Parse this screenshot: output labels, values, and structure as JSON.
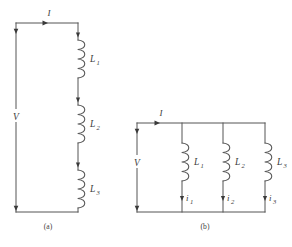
{
  "figure": {
    "background_color": "#ffffff",
    "line_color": "#555555",
    "text_color": "#3c3c3c"
  },
  "panels": [
    {
      "id": "panel-a",
      "caption": "(a)",
      "configuration": "series",
      "source_label": "V",
      "total_current_label": "I",
      "inductors": [
        {
          "label": "L",
          "subscript": "1"
        },
        {
          "label": "L",
          "subscript": "2"
        },
        {
          "label": "L",
          "subscript": "3"
        }
      ],
      "branch_currents": []
    },
    {
      "id": "panel-b",
      "caption": "(b)",
      "configuration": "parallel",
      "source_label": "V",
      "total_current_label": "I",
      "inductors": [
        {
          "label": "L",
          "subscript": "1"
        },
        {
          "label": "L",
          "subscript": "2"
        },
        {
          "label": "L",
          "subscript": "3"
        }
      ],
      "branch_currents": [
        {
          "label": "i",
          "subscript": "1"
        },
        {
          "label": "i",
          "subscript": "2"
        },
        {
          "label": "i",
          "subscript": "3"
        }
      ]
    }
  ],
  "labels": {
    "a_caption": "(a)",
    "b_caption": "(b)",
    "a_current": "I",
    "a_voltage": "V",
    "a_L1": "L",
    "a_L1_sub": "1",
    "a_L2": "L",
    "a_L2_sub": "2",
    "a_L3": "L",
    "a_L3_sub": "3",
    "b_current": "I",
    "b_voltage": "V",
    "b_L1": "L",
    "b_L1_sub": "1",
    "b_L2": "L",
    "b_L2_sub": "2",
    "b_L3": "L",
    "b_L3_sub": "3",
    "b_i1": "i",
    "b_i1_sub": "1",
    "b_i2": "i",
    "b_i2_sub": "2",
    "b_i3": "i",
    "b_i3_sub": "3"
  }
}
